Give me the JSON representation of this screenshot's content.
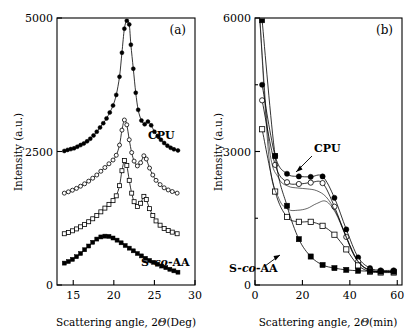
{
  "figure": {
    "panels": [
      {
        "tag": "(a)",
        "xlabel_prefix": "Scattering angle, 2",
        "xlabel_theta": "Θ",
        "xlabel_units": "(Deg)",
        "ylabel": "Intensity (a.u.)",
        "labels": {
          "top": "CPU",
          "bottom_a": "S-",
          "bottom_b": "co",
          "bottom_c": "-AA"
        }
      },
      {
        "tag": "(b)",
        "xlabel_prefix": "Scattering angle, 2",
        "xlabel_theta": "Θ",
        "xlabel_units": "(min)",
        "ylabel": "Intensity (a.u.)",
        "labels": {
          "top": "CPU",
          "bottom_a": "S-",
          "bottom_b": "co",
          "bottom_c": "-AA"
        }
      }
    ]
  },
  "chart_data": [
    {
      "type": "line",
      "panel": "(a)",
      "title": "",
      "xlabel": "Scattering angle, 2Θ (Deg)",
      "ylabel": "Intensity (a.u.)",
      "xlim": [
        13,
        30
      ],
      "ylim": [
        0,
        5000
      ],
      "xticks": [
        15,
        20,
        25,
        30
      ],
      "yticks": [
        0,
        2500,
        5000
      ],
      "grid": false,
      "legend": "none",
      "annotations": [
        {
          "text": "CPU",
          "x": 25.3,
          "y": 3000
        },
        {
          "text": "S-co-AA",
          "x": 25.2,
          "y": 520
        }
      ],
      "series": [
        {
          "name": "CPU",
          "marker": "filled-circle",
          "x": [
            13.9,
            14.3,
            14.7,
            15.1,
            15.5,
            15.9,
            16.3,
            16.7,
            17.1,
            17.5,
            17.9,
            18.3,
            18.7,
            19.1,
            19.5,
            19.9,
            20.3,
            20.7,
            21.0,
            21.3,
            21.6,
            21.9,
            22.1,
            22.4,
            22.7,
            23.0,
            23.4,
            23.8,
            24.2,
            24.6,
            25.0,
            25.4,
            25.8,
            26.2,
            26.6,
            27.0,
            27.4,
            27.9
          ],
          "y": [
            2510,
            2530,
            2545,
            2560,
            2590,
            2620,
            2650,
            2690,
            2740,
            2800,
            2870,
            2950,
            3030,
            3120,
            3230,
            3360,
            3560,
            3900,
            4350,
            4800,
            4950,
            4880,
            4500,
            4050,
            3600,
            3280,
            3080,
            3010,
            3060,
            2990,
            2870,
            2790,
            2720,
            2660,
            2610,
            2570,
            2540,
            2520
          ]
        },
        {
          "name": "intermediate-open-circle",
          "marker": "open-circle",
          "x": [
            13.9,
            14.4,
            14.9,
            15.4,
            15.9,
            16.4,
            16.9,
            17.4,
            17.9,
            18.4,
            18.9,
            19.4,
            19.9,
            20.3,
            20.7,
            21.0,
            21.3,
            21.6,
            21.9,
            22.2,
            22.5,
            22.9,
            23.3,
            23.7,
            24.0,
            24.4,
            24.8,
            25.2,
            25.7,
            26.2,
            26.7,
            27.2,
            27.8
          ],
          "y": [
            1720,
            1745,
            1775,
            1810,
            1850,
            1895,
            1945,
            2000,
            2060,
            2130,
            2200,
            2270,
            2340,
            2430,
            2620,
            2900,
            3090,
            3000,
            2720,
            2480,
            2320,
            2230,
            2290,
            2420,
            2360,
            2190,
            2060,
            1960,
            1880,
            1820,
            1780,
            1750,
            1720
          ]
        },
        {
          "name": "intermediate-open-square",
          "marker": "open-square",
          "x": [
            13.9,
            14.4,
            14.9,
            15.4,
            15.9,
            16.4,
            16.9,
            17.4,
            17.9,
            18.4,
            18.9,
            19.4,
            19.9,
            20.3,
            20.7,
            21.0,
            21.3,
            21.6,
            21.9,
            22.2,
            22.5,
            22.9,
            23.3,
            23.7,
            24.0,
            24.4,
            24.8,
            25.2,
            25.7,
            26.2,
            26.7,
            27.2,
            27.8
          ],
          "y": [
            960,
            985,
            1015,
            1050,
            1090,
            1135,
            1185,
            1240,
            1300,
            1370,
            1440,
            1510,
            1580,
            1670,
            1860,
            2140,
            2330,
            2240,
            1960,
            1720,
            1560,
            1470,
            1530,
            1660,
            1600,
            1430,
            1300,
            1200,
            1120,
            1060,
            1020,
            990,
            960
          ]
        },
        {
          "name": "S-co-AA",
          "marker": "filled-square",
          "x": [
            13.9,
            14.4,
            14.9,
            15.4,
            15.9,
            16.4,
            16.9,
            17.4,
            17.9,
            18.4,
            18.9,
            19.4,
            19.9,
            20.4,
            20.9,
            21.4,
            21.9,
            22.4,
            22.9,
            23.4,
            23.9,
            24.4,
            24.9,
            25.4,
            25.9,
            26.4,
            26.9,
            27.4,
            27.9
          ],
          "y": [
            410,
            440,
            480,
            530,
            590,
            660,
            730,
            800,
            860,
            900,
            915,
            910,
            880,
            840,
            790,
            740,
            690,
            640,
            590,
            545,
            500,
            460,
            425,
            390,
            355,
            325,
            295,
            265,
            240
          ]
        }
      ]
    },
    {
      "type": "line",
      "panel": "(b)",
      "title": "",
      "xlabel": "Scattering angle, 2Θ (min)",
      "ylabel": "Intensity (a.u.)",
      "xlim": [
        0,
        62
      ],
      "ylim": [
        0,
        6000
      ],
      "xticks": [
        0,
        20,
        40,
        60
      ],
      "yticks": [
        0,
        3000,
        6000
      ],
      "grid": false,
      "legend": "none",
      "annotations": [
        {
          "text": "CPU",
          "x": 31,
          "y": 3400
        },
        {
          "text": "S-co-AA",
          "x": 8,
          "y": 520
        }
      ],
      "series": [
        {
          "name": "CPU",
          "marker": "filled-circle",
          "x": [
            3.0,
            8.5,
            13.5,
            18.5,
            23.5,
            28.5,
            33.5,
            38.5,
            43.5,
            48.5,
            53.0,
            58.5
          ],
          "y": [
            4500,
            2900,
            2500,
            2440,
            2430,
            2440,
            1960,
            1250,
            620,
            380,
            330,
            330
          ]
        },
        {
          "name": "open-circle",
          "marker": "open-circle",
          "x": [
            3.0,
            8.5,
            13.5,
            18.5,
            23.5,
            28.5,
            33.5,
            38.5,
            43.5,
            48.5,
            53.0,
            58.5
          ],
          "y": [
            4150,
            2700,
            2310,
            2270,
            2300,
            2290,
            1760,
            1080,
            530,
            330,
            300,
            300
          ]
        },
        {
          "name": "open-square",
          "marker": "open-square",
          "x": [
            3.0,
            8.5,
            13.5,
            18.5,
            23.5,
            28.5,
            33.5,
            38.5,
            43.5,
            48.5,
            53.0,
            58.5
          ],
          "y": [
            3500,
            2100,
            1530,
            1420,
            1420,
            1330,
            1130,
            800,
            440,
            300,
            280,
            280
          ]
        },
        {
          "name": "S-co-AA",
          "marker": "filled-square",
          "x": [
            3.0,
            8.5,
            13.5,
            18.5,
            23.5,
            28.5,
            33.5,
            38.5,
            43.5,
            48.5,
            53.0,
            58.5
          ],
          "y": [
            5950,
            2900,
            1780,
            1030,
            640,
            450,
            380,
            340,
            320,
            310,
            300,
            300
          ]
        },
        {
          "name": "smooth-fit-upper",
          "marker": "none",
          "x": [
            2.0,
            6,
            10,
            14,
            18,
            22,
            26,
            30,
            34,
            38,
            42,
            46,
            50,
            54,
            58
          ],
          "y": [
            6000,
            3100,
            2400,
            2220,
            2180,
            2160,
            2120,
            1980,
            1650,
            1150,
            650,
            400,
            320,
            305,
            300
          ]
        },
        {
          "name": "smooth-fit-lower",
          "marker": "none",
          "x": [
            2.0,
            6,
            10,
            14,
            18,
            22,
            26,
            30,
            34,
            38,
            42,
            46,
            50,
            54,
            58
          ],
          "y": [
            6000,
            2800,
            1950,
            1700,
            1680,
            1720,
            1830,
            1880,
            1620,
            1130,
            640,
            390,
            310,
            300,
            295
          ]
        }
      ]
    }
  ]
}
